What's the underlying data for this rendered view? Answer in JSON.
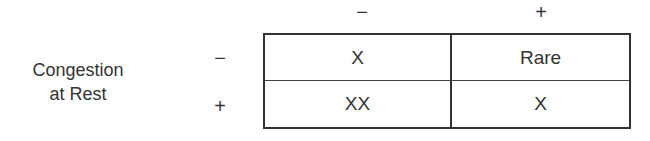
{
  "row_label": {
    "line1": "Congestion",
    "line2": "at Rest"
  },
  "column_headers": [
    "−",
    "+"
  ],
  "row_headers": [
    "−",
    "+"
  ],
  "cells": [
    [
      "X",
      "Rare"
    ],
    [
      "XX",
      "X"
    ]
  ],
  "colors": {
    "line": "#333333",
    "text": "#333333",
    "background": "#ffffff"
  }
}
